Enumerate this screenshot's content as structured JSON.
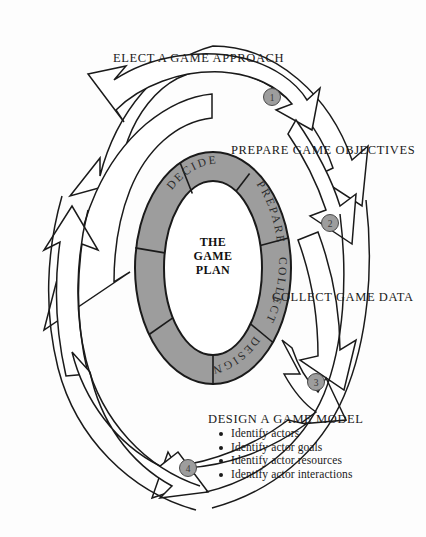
{
  "diagram": {
    "title": "The Game Plan",
    "center_text_lines": [
      "THE",
      "GAME",
      "PLAN"
    ],
    "colors": {
      "background": "#fdfdfd",
      "ring_fill": "#9d9d9d",
      "ring_stroke": "#1a1a1a",
      "ring_inner_fill": "#ffffff",
      "arrow_fill": "#ffffff",
      "arrow_stroke": "#1a1a1a",
      "badge_fill": "#9d9d9d",
      "badge_stroke": "#4a4a4a",
      "text": "#1a1a1a"
    },
    "ring_segments": [
      {
        "id": "decide",
        "label": "DECIDE"
      },
      {
        "id": "prepare",
        "label": "PREPARE"
      },
      {
        "id": "collect",
        "label": "COLLECT"
      },
      {
        "id": "design",
        "label": "DESIGN"
      },
      {
        "id": "blank-upper-left",
        "label": ""
      },
      {
        "id": "blank-lower-left",
        "label": ""
      }
    ],
    "steps": [
      {
        "number": "1",
        "label": "ELECT A GAME APPROACH",
        "badge": "1"
      },
      {
        "number": "2",
        "label": "PREPARE GAME OBJECTIVES",
        "badge": "2"
      },
      {
        "number": "3",
        "label": "COLLECT GAME DATA",
        "badge": "3"
      },
      {
        "number": "4",
        "label": "DESIGN A GAME MODEL",
        "badge": "4",
        "bullets": [
          "Identify actors",
          "Identify actor goals",
          "Identify actor resources",
          "Identify actor interactions"
        ]
      }
    ]
  }
}
